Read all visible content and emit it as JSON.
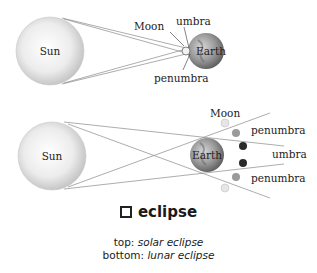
{
  "solar_eclipse": {
    "sun_label": "Sun",
    "moon_label": "Moon",
    "earth_label": "Earth",
    "umbra_label": "umbra",
    "penumbra_label": "penumbra"
  },
  "lunar_eclipse": {
    "sun_label": "Sun",
    "earth_label": "Earth",
    "moon_label": "Moon",
    "penumbra_top_label": "penumbra",
    "umbra_label": "umbra",
    "penumbra_bottom_label": "penumbra"
  },
  "caption": {
    "headword": "eclipse",
    "line1_prefix": "top: ",
    "line1_term": "solar eclipse",
    "line2_prefix": "bottom: ",
    "line2_term": "lunar eclipse"
  },
  "colors": {
    "sun_fill": "#e8e8e8",
    "ray_line": "#888888",
    "moon_light": "#e0e0e0",
    "moon_medium": "#9a9a9a",
    "moon_dark": "#2a2a2a"
  }
}
